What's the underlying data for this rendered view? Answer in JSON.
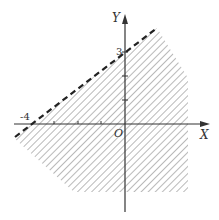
{
  "diagram": {
    "type": "inequality-region",
    "axes": {
      "x_label": "X",
      "y_label": "Y",
      "origin_label": "O"
    },
    "labels": {
      "x_intercept": "-4",
      "y_intercept": "3"
    },
    "boundary_line": {
      "style": "dashed",
      "points": [
        [
          -4,
          0
        ],
        [
          0,
          3
        ]
      ]
    },
    "shading": {
      "style": "diagonal-hatch",
      "side": "below-right"
    },
    "colors": {
      "axis": "#333333",
      "hatch": "#9a9a9a",
      "boundary": "#222222"
    }
  }
}
